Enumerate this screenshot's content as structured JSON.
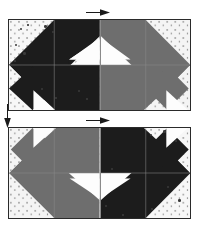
{
  "figure": {
    "background_color": "#fdfdfd",
    "dark_fabric_color": "#1c1c1c",
    "medium_fabric_color": "#6e6e6e",
    "background_fabric_color": "#f6f6f6",
    "seam_line_color": "#8a8a8a",
    "outline_color": "#2a2a2a",
    "arrow_color": "#1a1a1a"
  },
  "annotations": [
    {
      "name": "top-pressing-arrow",
      "direction": "right",
      "label": "→"
    },
    {
      "name": "middle-pressing-arrow",
      "direction": "right",
      "label": "→"
    },
    {
      "name": "left-pressing-arrow",
      "direction": "down",
      "label": "↓"
    }
  ],
  "rows": [
    {
      "name": "top-row",
      "blocks": [
        {
          "name": "block-top-left",
          "fabric": "dark",
          "fabric_color": "#1c1c1c",
          "orientation": "left"
        },
        {
          "name": "block-top-right",
          "fabric": "medium",
          "fabric_color": "#6e6e6e",
          "orientation": "right"
        }
      ]
    },
    {
      "name": "bottom-row",
      "blocks": [
        {
          "name": "block-bottom-left",
          "fabric": "medium",
          "fabric_color": "#6e6e6e",
          "orientation": "left-flipped"
        },
        {
          "name": "block-bottom-right",
          "fabric": "dark",
          "fabric_color": "#1c1c1c",
          "orientation": "right-flipped"
        }
      ]
    }
  ]
}
